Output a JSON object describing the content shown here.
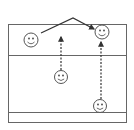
{
  "diagram": {
    "colors": {
      "line": "#555555",
      "background": "#ffffff",
      "face": "#333333"
    },
    "court": {
      "x": 8.5,
      "y": 24.5,
      "width": 118,
      "height": 98,
      "lines_y": [
        55.5,
        112.5
      ]
    },
    "players": [
      {
        "id": "p1",
        "cx": 31,
        "cy": 40,
        "r": 7
      },
      {
        "id": "p2",
        "cx": 102,
        "cy": 32,
        "r": 7
      },
      {
        "id": "p3",
        "cx": 61,
        "cy": 77,
        "r": 6.5
      },
      {
        "id": "p4",
        "cx": 100,
        "cy": 106,
        "r": 6.5
      }
    ],
    "paths": [
      {
        "id": "pass-route",
        "style": "solid",
        "points": "41,33 73,18 94,29"
      },
      {
        "id": "run-p3",
        "style": "dashed",
        "points": "61,70 61,37"
      },
      {
        "id": "run-p4",
        "style": "dashed",
        "points": "101,99 101,42"
      }
    ]
  }
}
